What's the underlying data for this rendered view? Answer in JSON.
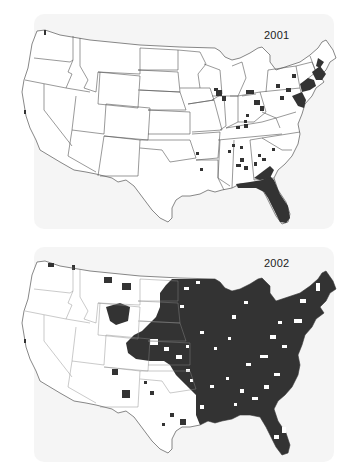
{
  "figure": {
    "panels": [
      {
        "id": "map-2001",
        "year_label": "2001",
        "description": "US county map; shaded counties concentrated in Florida, the Northeast coast, and scattered in the Southeast and Great Lakes",
        "fill_color": "#333333",
        "border_color": "#555555",
        "background": "#ffffff"
      },
      {
        "id": "map-2002",
        "year_label": "2002",
        "description": "US county map; shaded counties cover most of the eastern half of the US through the Great Plains, with scattered counties in the West",
        "fill_color": "#333333",
        "border_color": "#555555",
        "background": "#ffffff"
      }
    ]
  }
}
